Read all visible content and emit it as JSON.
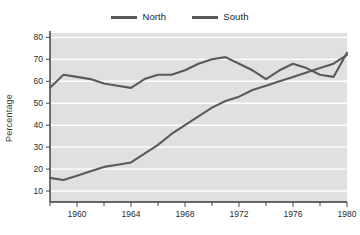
{
  "chart_data": {
    "type": "line",
    "title": "",
    "subtitle": "",
    "xlabel": "",
    "ylabel": "Percentage",
    "xlim": [
      1958,
      1980
    ],
    "ylim": [
      5,
      82
    ],
    "yticks": [
      10,
      20,
      30,
      40,
      50,
      60,
      70,
      80
    ],
    "ytick_labels": [
      "10",
      "20",
      "30",
      "40",
      "50",
      "60",
      "70",
      "80"
    ],
    "xticks": [
      1960,
      1964,
      1968,
      1972,
      1976,
      1980
    ],
    "xtick_labels": [
      "1960",
      "1964",
      "1968",
      "1972",
      "1976",
      "1980"
    ],
    "x_minor_ticks": [
      1958,
      1962,
      1966,
      1970,
      1974,
      1978
    ],
    "grid": "horizontal",
    "legend_position": "top-center",
    "plot_background": "#e0e0e0",
    "gridline_color": "#ffffff",
    "line_color": "#5a5a5a",
    "x": [
      1958,
      1959,
      1960,
      1961,
      1962,
      1963,
      1964,
      1965,
      1966,
      1967,
      1968,
      1969,
      1970,
      1971,
      1972,
      1973,
      1974,
      1975,
      1976,
      1977,
      1978,
      1979,
      1980
    ],
    "series": [
      {
        "name": "North",
        "color": "#5a5a5a",
        "values": [
          57,
          63,
          62,
          61,
          59,
          58,
          57,
          61,
          63,
          63,
          65,
          68,
          70,
          71,
          68,
          65,
          61,
          65,
          68,
          66,
          63,
          62,
          73
        ]
      },
      {
        "name": "South",
        "color": "#5a5a5a",
        "values": [
          16,
          15,
          17,
          19,
          21,
          22,
          23,
          27,
          31,
          36,
          40,
          44,
          48,
          51,
          53,
          56,
          58,
          60,
          62,
          64,
          66,
          68,
          72
        ]
      }
    ]
  },
  "legend": {
    "entries": [
      {
        "label": "North",
        "swatch": "line-swatch-north"
      },
      {
        "label": "South",
        "swatch": "line-swatch-south"
      }
    ]
  },
  "axes": {
    "y_title": "Percentage"
  }
}
